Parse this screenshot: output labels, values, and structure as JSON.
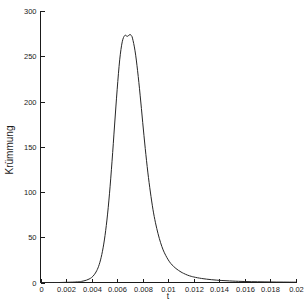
{
  "chart_data": {
    "type": "line",
    "title": "",
    "xlabel": "t",
    "ylabel": "Krümmung",
    "xlim": [
      0,
      0.02
    ],
    "ylim": [
      0,
      300
    ],
    "grid": false,
    "legend": null,
    "xticks": [
      0,
      0.002,
      0.004,
      0.006,
      0.008,
      0.01,
      0.012,
      0.014,
      0.016,
      0.018,
      0.02
    ],
    "xtick_labels": [
      "0",
      "0.002",
      "0.004",
      "0.006",
      "0.008",
      "0.01",
      "0.012",
      "0.014",
      "0.016",
      "0.018",
      "0.02"
    ],
    "yticks": [
      0,
      50,
      100,
      150,
      200,
      250,
      300
    ],
    "ytick_labels": [
      "0",
      "50",
      "100",
      "150",
      "200",
      "250",
      "300"
    ],
    "series": [
      {
        "name": "Krümmung",
        "color": "#262626",
        "peak_x": 0.0071,
        "peak_y": 273,
        "x": [
          0,
          0.0005,
          0.001,
          0.0015,
          0.002,
          0.0025,
          0.003,
          0.0032,
          0.0034,
          0.0036,
          0.0038,
          0.004,
          0.0042,
          0.0044,
          0.0046,
          0.0048,
          0.005,
          0.0052,
          0.0054,
          0.0056,
          0.0058,
          0.006,
          0.0062,
          0.0064,
          0.0066,
          0.0068,
          0.007,
          0.0071,
          0.0072,
          0.0074,
          0.0076,
          0.0078,
          0.008,
          0.0082,
          0.0084,
          0.0086,
          0.0088,
          0.009,
          0.0092,
          0.0094,
          0.0096,
          0.0098,
          0.01,
          0.0102,
          0.0104,
          0.0106,
          0.0108,
          0.011,
          0.0112,
          0.0115,
          0.0118,
          0.012,
          0.0123,
          0.0126,
          0.013,
          0.0134,
          0.0138,
          0.0142,
          0.0146,
          0.015,
          0.0155,
          0.016,
          0.0165,
          0.017,
          0.0175,
          0.018,
          0.0185,
          0.019,
          0.0195,
          0.02
        ],
        "y": [
          0,
          0,
          0,
          0,
          0.2,
          0.4,
          0.8,
          1.2,
          1.8,
          2.6,
          3.8,
          5.5,
          8.5,
          13,
          20,
          31,
          47,
          69,
          98,
          134,
          174,
          213,
          246,
          266,
          273,
          272,
          274,
          273,
          270,
          256,
          234,
          207,
          177,
          148,
          122,
          100,
          81,
          66,
          54,
          44,
          36,
          30,
          25,
          21,
          18,
          15.5,
          13.4,
          11.6,
          10.1,
          8.2,
          6.8,
          6.1,
          5.2,
          4.5,
          3.7,
          3.1,
          2.6,
          2.2,
          1.9,
          1.6,
          1.3,
          1.1,
          0.9,
          0.8,
          0.7,
          0.6,
          0.5,
          0.45,
          0.4,
          0.35
        ]
      }
    ]
  },
  "axes": {
    "x_axis_name": "t",
    "y_axis_name": "Krümmung"
  }
}
